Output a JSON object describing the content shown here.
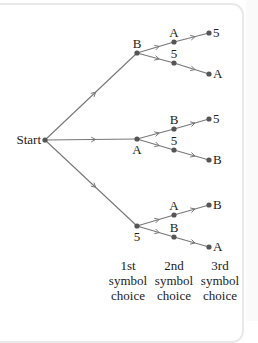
{
  "diagram": {
    "type": "tree-diagram",
    "root": {
      "label": "Start",
      "x": 45,
      "y": 140
    },
    "level1": [
      {
        "label": "B",
        "x": 137,
        "y": 53,
        "label_pos": "above"
      },
      {
        "label": "A",
        "x": 137,
        "y": 139,
        "label_pos": "below"
      },
      {
        "label": "5",
        "x": 137,
        "y": 226,
        "label_pos": "below"
      }
    ],
    "level2": [
      {
        "parent": 0,
        "label": "A",
        "x": 174,
        "y": 42,
        "leaf": {
          "label": "5",
          "x": 209,
          "y": 33
        }
      },
      {
        "parent": 0,
        "label": "5",
        "x": 174,
        "y": 63,
        "leaf": {
          "label": "A",
          "x": 209,
          "y": 74
        }
      },
      {
        "parent": 1,
        "label": "B",
        "x": 174,
        "y": 129,
        "leaf": {
          "label": "5",
          "x": 209,
          "y": 119
        }
      },
      {
        "parent": 1,
        "label": "5",
        "x": 174,
        "y": 150,
        "leaf": {
          "label": "B",
          "x": 209,
          "y": 160
        }
      },
      {
        "parent": 2,
        "label": "A",
        "x": 174,
        "y": 215,
        "leaf": {
          "label": "B",
          "x": 209,
          "y": 205
        }
      },
      {
        "parent": 2,
        "label": "B",
        "x": 174,
        "y": 237,
        "leaf": {
          "label": "A",
          "x": 209,
          "y": 247
        }
      }
    ],
    "column_labels": [
      {
        "lines": [
          "1st",
          "symbol",
          "choice"
        ],
        "x": 128
      },
      {
        "lines": [
          "2nd",
          "symbol",
          "choice"
        ],
        "x": 174
      },
      {
        "lines": [
          "3rd",
          "symbol",
          "choice"
        ],
        "x": 220
      }
    ],
    "colors": {
      "line": "#777777",
      "node": "#555555",
      "text": "#222222",
      "border": "#e9e9e9"
    }
  }
}
